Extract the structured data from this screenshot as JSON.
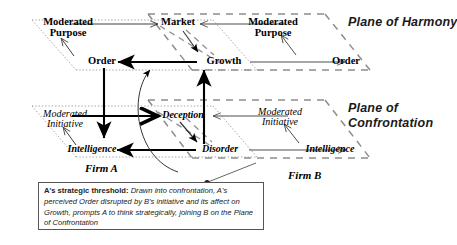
{
  "diagram": {
    "title_nodes": {
      "a_mod_purpose": "Moderated\nPurpose",
      "market": "Market",
      "b_mod_purpose": "Moderated\nPurpose",
      "a_order": "Order",
      "growth": "Growth",
      "b_order": "Order",
      "a_mod_initiative": "Moderated\nInitiative",
      "deception": "Deception",
      "b_mod_initiative": "Moderated\nInitiative",
      "a_intelligence": "Intelligence",
      "disorder": "Disorder",
      "b_intelligence": "Intelligence"
    },
    "nodes": [
      {
        "id": "a-moderated-purpose",
        "line1": "Moderated",
        "line2": "Purpose",
        "style": "serif-b"
      },
      {
        "id": "market",
        "line1": "Market",
        "line2": "",
        "style": "serif-b"
      },
      {
        "id": "b-moderated-purpose",
        "line1": "Moderated",
        "line2": "Purpose",
        "style": "serif-b"
      },
      {
        "id": "a-order",
        "line1": "Order",
        "line2": "",
        "style": "serif-b"
      },
      {
        "id": "growth",
        "line1": "Growth",
        "line2": "",
        "style": "serif-b"
      },
      {
        "id": "b-order",
        "line1": "Order",
        "line2": "",
        "style": "serif-b"
      },
      {
        "id": "a-moderated-initiative",
        "line1": "Moderated",
        "line2": "Initiative",
        "style": "serif-i"
      },
      {
        "id": "deception",
        "line1": "Deception",
        "line2": "",
        "style": "serif-ib"
      },
      {
        "id": "b-moderated-initiative",
        "line1": "Moderated",
        "line2": "Initiative",
        "style": "serif-i"
      },
      {
        "id": "a-intelligence",
        "line1": "Intelligence",
        "line2": "",
        "style": "serif-ib"
      },
      {
        "id": "disorder",
        "line1": "Disorder",
        "line2": "",
        "style": "serif-ib"
      },
      {
        "id": "b-intelligence",
        "line1": "Intelligence",
        "line2": "",
        "style": "serif-ib"
      }
    ],
    "plane_labels": {
      "harmony_line1": "Plane of Harmony",
      "harmony_line2": "",
      "confrontation_line1": "Plane of",
      "confrontation_line2": "Confrontation"
    },
    "firm_labels": {
      "firm_a": "Firm A",
      "firm_b": "Firm B"
    },
    "caption": {
      "lead": "A's strategic threshold:",
      "body": " Drawn into confrontation, A's perceived Order disrupted by B's initiative and its affect on Growth, prompts A to think strategically, joining B on the Plane of Confrontation"
    },
    "colors": {
      "ink": "#000000",
      "plane_gray": "#8d8d8d",
      "dotted_gray": "#9a9a9a",
      "box_border": "#555555",
      "caption_text": "#222222"
    }
  }
}
